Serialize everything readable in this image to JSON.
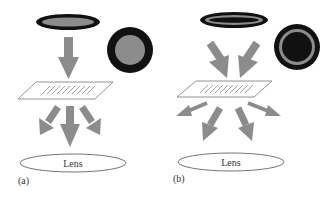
{
  "figure": {
    "colors": {
      "arrow": "#8c8c8c",
      "ring_dark": "#111111",
      "ring_gray": "#8c8c8c",
      "outline": "#666666",
      "text": "#333333"
    },
    "panels": [
      {
        "id": "a",
        "label": "(a)",
        "lens_label": "Lens",
        "illumination": "filled disc (brightfield)",
        "scatter_arrows": 3
      },
      {
        "id": "b",
        "label": "(b)",
        "lens_label": "Lens",
        "illumination": "annular ring (darkfield)",
        "scatter_arrows": 4
      }
    ]
  }
}
